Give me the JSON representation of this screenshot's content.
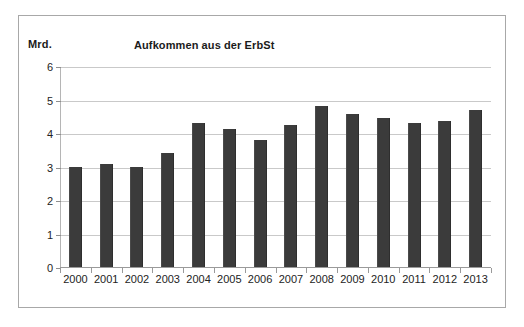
{
  "figure": {
    "y_axis_unit_label": "Mrd.",
    "title": "Aufkommen aus der ErbSt",
    "border_color": "#a8a8a8",
    "bar_color": "#3b3b3b",
    "gridline_color": "#c9c9c9",
    "axis_color": "#9a9a9a"
  },
  "chart_data": {
    "type": "bar",
    "title": "Aufkommen aus der ErbSt",
    "xlabel": "",
    "ylabel": "Mrd.",
    "ylim": [
      0,
      6
    ],
    "yticks": [
      0,
      1,
      2,
      3,
      4,
      5,
      6
    ],
    "ytick_labels": [
      "0",
      "1",
      "2",
      "3",
      "4",
      "5",
      "6"
    ],
    "grid": true,
    "legend": null,
    "categories": [
      "2000",
      "2001",
      "2002",
      "2003",
      "2004",
      "2005",
      "2006",
      "2007",
      "2008",
      "2009",
      "2010",
      "2011",
      "2012",
      "2013"
    ],
    "values": [
      2.99,
      3.08,
      3.0,
      3.4,
      4.3,
      4.12,
      3.8,
      4.23,
      4.82,
      4.58,
      4.45,
      4.29,
      4.35,
      4.7
    ],
    "series": [
      {
        "name": "Aufkommen aus der ErbSt",
        "color": "#3b3b3b",
        "values": [
          2.99,
          3.08,
          3.0,
          3.4,
          4.3,
          4.12,
          3.8,
          4.23,
          4.82,
          4.58,
          4.45,
          4.29,
          4.35,
          4.7
        ]
      }
    ]
  }
}
